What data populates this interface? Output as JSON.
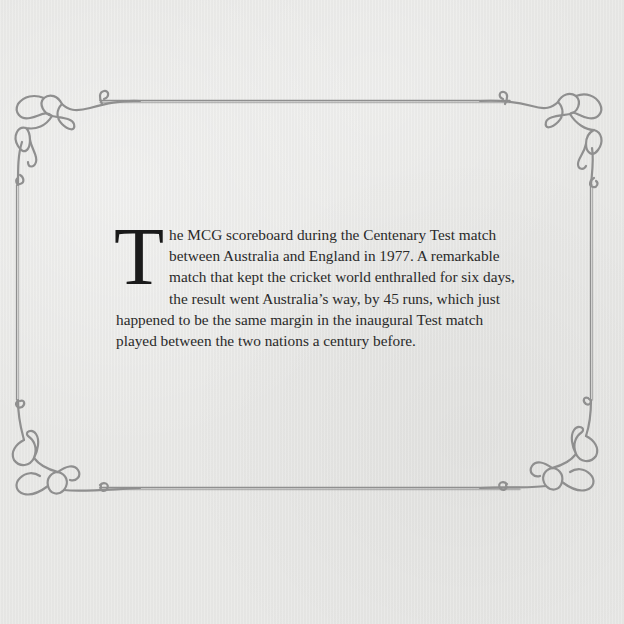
{
  "page": {
    "background_color": "#e9e9e7",
    "frame_color": "#8f8f8f"
  },
  "caption": {
    "drop_cap": "T",
    "text": "he MCG scoreboard during the Centenary Test match between Australia and England in 1977. A remarkable match that kept the cricket world enthralled for six days, the result went Australia’s way, by 45 runs, which just happened to be the same margin in the inaugural Test match played between the two nations a century before."
  },
  "frame": {
    "corners": [
      "top-left-knot-ornament",
      "top-right-knot-ornament",
      "bottom-left-knot-ornament",
      "bottom-right-knot-ornament"
    ]
  }
}
